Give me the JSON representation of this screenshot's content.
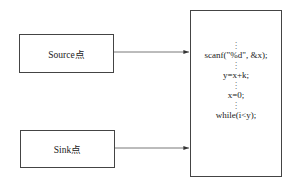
{
  "diagram": {
    "nodes": {
      "source": {
        "label": "Source点"
      },
      "sink": {
        "label": "Sink点"
      },
      "code": {
        "lines": [
          "scanf(\"%d\", &x);",
          "y=x+k;",
          "x=0;",
          "while(i<y);"
        ],
        "ellipsis": "⋮"
      }
    },
    "edges": [
      {
        "from": "source",
        "to": "code"
      },
      {
        "from": "sink",
        "to": "code"
      }
    ],
    "colors": {
      "stroke": "#444444",
      "text": "#222222",
      "background": "#ffffff"
    }
  }
}
